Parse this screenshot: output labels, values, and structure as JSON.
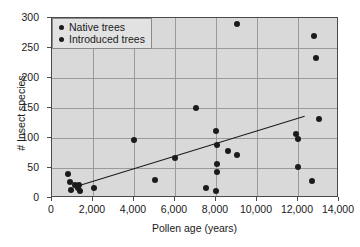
{
  "chart_data": {
    "type": "scatter",
    "title": "",
    "xlabel": "Pollen age (years)",
    "ylabel": "# Insect species",
    "xlim": [
      0,
      14000
    ],
    "ylim": [
      0,
      300
    ],
    "xticks": [
      0,
      2000,
      4000,
      6000,
      8000,
      10000,
      12000,
      14000
    ],
    "xticklabels": [
      "0",
      "2,000",
      "4,000",
      "6,000",
      "8,000",
      "10,000",
      "12,000",
      "14,000"
    ],
    "yticks": [
      0,
      50,
      100,
      150,
      200,
      250,
      300
    ],
    "yticklabels": [
      "0",
      "50",
      "100",
      "150",
      "200",
      "250",
      "300"
    ],
    "grid": true,
    "legend_position": "top-left",
    "legend": [
      {
        "label": "Native trees",
        "marker": "filled-circle",
        "color": "#1b1b1b"
      },
      {
        "label": "Introduced trees",
        "marker": "filled-circle",
        "color": "#1b1b1b"
      }
    ],
    "series": [
      {
        "name": "Native trees",
        "marker": "filled-circle",
        "color": "#1b1b1b",
        "points": [
          [
            800,
            40
          ],
          [
            900,
            27
          ],
          [
            950,
            13
          ],
          [
            1100,
            22
          ],
          [
            1200,
            20
          ],
          [
            1250,
            16
          ],
          [
            1300,
            22
          ],
          [
            1350,
            12
          ],
          [
            2050,
            17
          ],
          [
            4000,
            97
          ],
          [
            5000,
            30
          ],
          [
            6000,
            67
          ],
          [
            7000,
            150
          ],
          [
            7500,
            17
          ],
          [
            8000,
            11
          ],
          [
            8000,
            112
          ],
          [
            8050,
            88
          ],
          [
            8050,
            57
          ],
          [
            8050,
            44
          ],
          [
            8600,
            78
          ],
          [
            9000,
            290
          ],
          [
            9000,
            71
          ],
          [
            11900,
            107
          ],
          [
            12000,
            98
          ],
          [
            12000,
            52
          ],
          [
            12700,
            28
          ],
          [
            12800,
            270
          ],
          [
            12900,
            234
          ],
          [
            13000,
            132
          ]
        ]
      }
    ],
    "trendline": {
      "x_start": 1150,
      "y_start": 20,
      "x_end": 12300,
      "y_end": 137,
      "color": "#1b1b1b"
    }
  }
}
